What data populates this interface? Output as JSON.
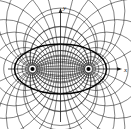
{
  "figure": {
    "title": "",
    "caption": "",
    "background_color": "#ffffff",
    "ink_color": "#1a1a1a",
    "width": 131,
    "height": 129
  },
  "axes": {
    "x_label": "x",
    "y_label": "y",
    "x_axis_name": "horizontal-axis",
    "y_axis_name": "vertical-axis",
    "origin": {
      "x": 60.5,
      "y": 69
    },
    "x_axis_start": {
      "x": 8,
      "y": 69
    },
    "x_axis_end": {
      "x": 122,
      "y": 69
    },
    "y_axis_start": {
      "x": 60.5,
      "y": 122
    },
    "y_axis_end": {
      "x": 60.5,
      "y": 8
    },
    "x_label_pos": {
      "x": 124,
      "y": 71
    },
    "y_label_pos": {
      "x": 63,
      "y": 9
    },
    "arrowheads": [
      "x-positive",
      "y-positive"
    ],
    "tick_labels": []
  },
  "foci": [
    {
      "name": "left-focus",
      "x": 32.5,
      "y": 69,
      "radius": 2.1,
      "label": ""
    },
    {
      "name": "right-focus",
      "x": 88.5,
      "y": 69,
      "radius": 2.1,
      "label": ""
    }
  ],
  "chart_data": {
    "type": "line",
    "xlabel": "x",
    "ylabel": "y",
    "grid": false,
    "legend": null,
    "xlim": [
      -2.15,
      2.15
    ],
    "ylim": [
      -2.15,
      2.15
    ],
    "focus_separation": 2,
    "focus_x": [
      -1,
      1
    ],
    "focus_y": [
      0,
      0
    ],
    "series": [
      {
        "name": "apollonius-circles-sigma",
        "description": "Circles of constant sigma centered on the x-axis, enclosing one focus each",
        "family": "sigma",
        "line_width": 0.55,
        "color": "#1a1a1a",
        "sigma_values": [
          -2.6,
          -2.2,
          -1.85,
          -1.55,
          -1.3,
          -1.08,
          -0.88,
          -0.7,
          -0.54,
          -0.39,
          -0.25,
          -0.12,
          0.12,
          0.25,
          0.39,
          0.54,
          0.7,
          0.88,
          1.08,
          1.3,
          1.55,
          1.85,
          2.2,
          2.6
        ]
      },
      {
        "name": "orthogonal-circles-tau",
        "description": "Circles of constant tau through both foci, centered on the y-axis",
        "family": "tau",
        "line_width": 0.55,
        "color": "#1a1a1a",
        "tau_values": [
          0.22,
          0.45,
          0.68,
          0.92,
          1.17,
          1.43,
          1.7,
          1.98,
          2.28,
          2.6,
          -0.22,
          -0.45,
          -0.68,
          -0.92,
          -1.17,
          -1.43,
          -1.7,
          -1.98,
          -2.28,
          -2.6
        ]
      },
      {
        "name": "highlighted-ellipse",
        "description": "Bold closed curve enclosing both foci",
        "line_width": 1.5,
        "color": "#000000",
        "center": {
          "x": 60.5,
          "y": 69
        },
        "semi_axis_x": 46,
        "semi_axis_y": 25
      }
    ]
  }
}
